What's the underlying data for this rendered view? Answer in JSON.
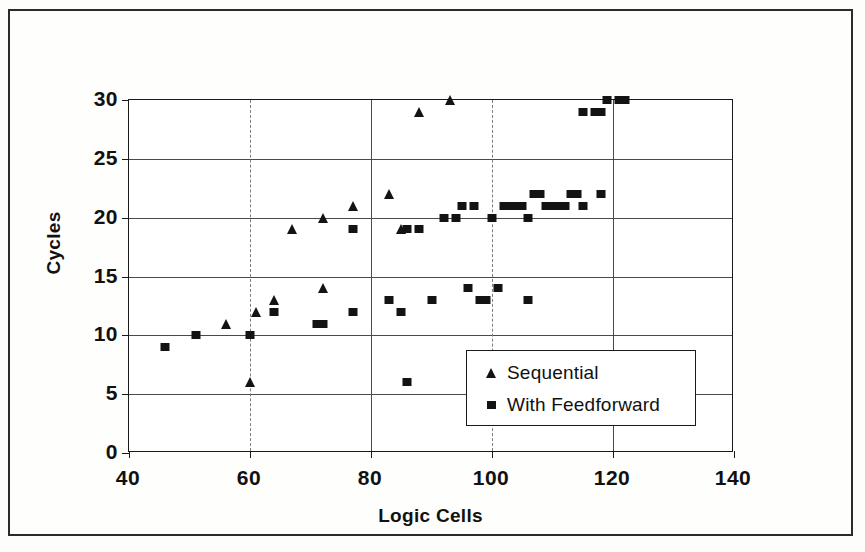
{
  "chart_data": {
    "type": "scatter",
    "title": "",
    "xlabel": "Logic Cells",
    "ylabel": "Cycles",
    "xlim": [
      40,
      140
    ],
    "ylim": [
      0,
      30
    ],
    "xticks": [
      40,
      60,
      80,
      100,
      120,
      140
    ],
    "yticks": [
      0,
      5,
      10,
      15,
      20,
      25,
      30
    ],
    "grid": true,
    "legend_position": "inside-lower-right",
    "series": [
      {
        "name": "Sequential",
        "marker": "triangle",
        "color": "#131313",
        "points": [
          [
            56,
            11
          ],
          [
            60,
            6
          ],
          [
            61,
            12
          ],
          [
            64,
            13
          ],
          [
            67,
            19
          ],
          [
            72,
            14
          ],
          [
            72,
            20
          ],
          [
            77,
            21
          ],
          [
            83,
            22
          ],
          [
            85,
            19
          ],
          [
            88,
            29
          ],
          [
            93,
            30
          ]
        ]
      },
      {
        "name": "With Feedforward",
        "marker": "square",
        "color": "#131313",
        "points": [
          [
            46,
            9
          ],
          [
            51,
            10
          ],
          [
            60,
            10
          ],
          [
            64,
            12
          ],
          [
            71,
            11
          ],
          [
            72,
            11
          ],
          [
            77,
            12
          ],
          [
            77,
            19
          ],
          [
            83,
            13
          ],
          [
            85,
            12
          ],
          [
            86,
            6
          ],
          [
            86,
            19
          ],
          [
            88,
            19
          ],
          [
            90,
            13
          ],
          [
            92,
            20
          ],
          [
            94,
            20
          ],
          [
            95,
            21
          ],
          [
            96,
            14
          ],
          [
            97,
            21
          ],
          [
            98,
            13
          ],
          [
            99,
            13
          ],
          [
            100,
            20
          ],
          [
            101,
            14
          ],
          [
            102,
            21
          ],
          [
            103,
            21
          ],
          [
            104,
            21
          ],
          [
            105,
            21
          ],
          [
            106,
            13
          ],
          [
            106,
            20
          ],
          [
            107,
            22
          ],
          [
            108,
            22
          ],
          [
            109,
            21
          ],
          [
            110,
            21
          ],
          [
            111,
            21
          ],
          [
            112,
            21
          ],
          [
            113,
            22
          ],
          [
            114,
            22
          ],
          [
            115,
            29
          ],
          [
            115,
            21
          ],
          [
            117,
            29
          ],
          [
            118,
            29
          ],
          [
            118,
            22
          ],
          [
            119,
            30
          ],
          [
            121,
            30
          ],
          [
            122,
            30
          ]
        ]
      }
    ]
  },
  "axis": {
    "x_title": "Logic Cells",
    "y_title": "Cycles"
  },
  "legend": {
    "items": [
      {
        "label": "Sequential",
        "marker": "triangle"
      },
      {
        "label": "With Feedforward",
        "marker": "square"
      }
    ]
  }
}
